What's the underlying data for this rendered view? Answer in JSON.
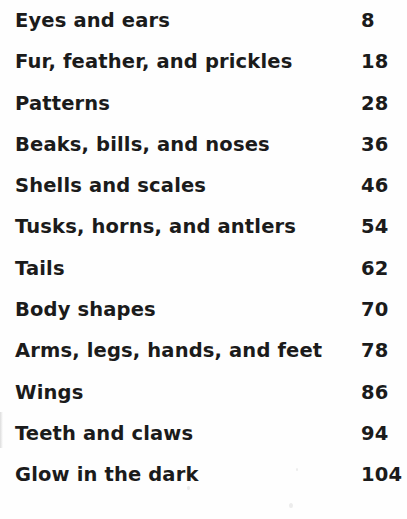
{
  "page": {
    "kind": "book-table-of-contents",
    "background_color": "#fefefe",
    "text_color": "#1b1b1b"
  },
  "contents": {
    "entries": [
      {
        "title": "Eyes and ears",
        "page": "8"
      },
      {
        "title": "Fur, feather, and prickles",
        "page": "18"
      },
      {
        "title": "Patterns",
        "page": "28"
      },
      {
        "title": "Beaks, bills, and noses",
        "page": "36"
      },
      {
        "title": "Shells and scales",
        "page": "46"
      },
      {
        "title": "Tusks, horns, and antlers",
        "page": "54"
      },
      {
        "title": "Tails",
        "page": "62"
      },
      {
        "title": "Body shapes",
        "page": "70"
      },
      {
        "title": "Arms, legs, hands, and feet",
        "page": "78"
      },
      {
        "title": "Wings",
        "page": "86"
      },
      {
        "title": "Teeth and claws",
        "page": "94"
      },
      {
        "title": "Glow in the dark",
        "page": "104"
      }
    ]
  }
}
